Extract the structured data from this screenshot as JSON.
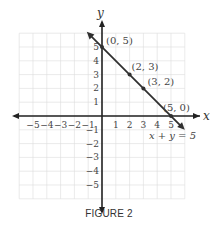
{
  "figure": {
    "caption": "FIGURE 2"
  },
  "chart_data": {
    "type": "line",
    "title": "",
    "xlabel": "x",
    "ylabel": "y",
    "xlim": [
      -6,
      6
    ],
    "ylim": [
      -6,
      6
    ],
    "grid": true,
    "x_ticks": [
      "−5",
      "−4",
      "−3",
      "−2",
      "−1",
      "1",
      "2",
      "3",
      "4",
      "5"
    ],
    "y_ticks": [
      "5",
      "4",
      "3",
      "2",
      "1",
      "−1",
      "−2",
      "−3",
      "−4",
      "−5"
    ],
    "series": [
      {
        "name": "x + y = 5",
        "equation": "x + y = 5",
        "x": [
          0,
          2,
          3,
          5
        ],
        "y": [
          5,
          3,
          2,
          0
        ]
      }
    ],
    "points": [
      {
        "label": "(0, 5)",
        "x": 0,
        "y": 5
      },
      {
        "label": "(2, 3)",
        "x": 2,
        "y": 3
      },
      {
        "label": "(3, 2)",
        "x": 3,
        "y": 2
      },
      {
        "label": "(5, 0)",
        "x": 5,
        "y": 0
      }
    ],
    "annotations": [
      "x + y = 5"
    ],
    "colors": {
      "line": "#2f2f2f",
      "grid": "#d9d9d9",
      "axis": "#222222"
    }
  }
}
